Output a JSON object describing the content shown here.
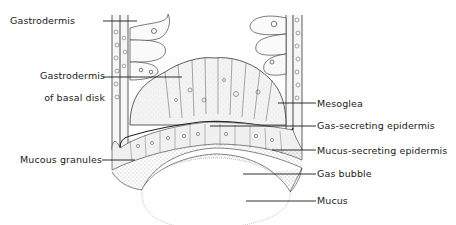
{
  "diagram": {
    "labels": {
      "gastrodermis": "Gastrodermis",
      "gastrodermis_basal_disk_line1": "Gastrodermis",
      "gastrodermis_basal_disk_line2": "of basal disk",
      "mesoglea": "Mesoglea",
      "gas_secreting_epidermis": "Gas-secreting epidermis",
      "mucous_granules": "Mucous granules",
      "mucus_secreting_epidermis": "Mucus-secreting epidermis",
      "gas_bubble": "Gas bubble",
      "mucus": "Mucus"
    },
    "colors": {
      "line": "#1a1a1a",
      "tissue_fill": "#f4f4f4",
      "stipple": "#333333",
      "bubble_outline": "#aaaaaa"
    }
  }
}
